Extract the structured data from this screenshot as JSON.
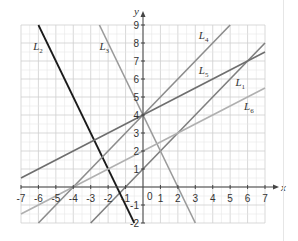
{
  "chart_data": {
    "type": "line",
    "title": "",
    "xlabel": "x",
    "ylabel": "y",
    "xlim": [
      -7,
      7
    ],
    "ylim": [
      -2,
      9
    ],
    "grid": true,
    "legend": "inline labels",
    "x_ticks": [
      -7,
      -6,
      -5,
      -4,
      -3,
      -2,
      -1,
      0,
      1,
      2,
      3,
      4,
      5,
      6,
      7
    ],
    "y_ticks": [
      -2,
      -1,
      1,
      2,
      3,
      4,
      5,
      6,
      7,
      8,
      9
    ],
    "series": [
      {
        "name": "L1",
        "equation": "y = x + 1",
        "slope": 1,
        "intercept": 1,
        "x": [
          -3,
          7
        ],
        "y": [
          -2,
          8
        ],
        "color": "#7f7f7f",
        "label_pos": [
          5.3,
          5.6
        ]
      },
      {
        "name": "L2",
        "equation": "y = -2x - 3",
        "slope": -2,
        "intercept": -3,
        "x": [
          -6,
          -0.5
        ],
        "y": [
          9,
          -2
        ],
        "color": "#1a1a1a",
        "label_pos": [
          -6.3,
          7.6
        ]
      },
      {
        "name": "L3",
        "equation": "y = -2x + 4",
        "slope": -2,
        "intercept": 4,
        "x": [
          -2.5,
          3
        ],
        "y": [
          9,
          -2
        ],
        "color": "#9a9a9a",
        "label_pos": [
          -2.5,
          7.6
        ]
      },
      {
        "name": "L4",
        "equation": "y = x + 4",
        "slope": 1,
        "intercept": 4,
        "x": [
          -6,
          5
        ],
        "y": [
          -2,
          9
        ],
        "color": "#8c8c8c",
        "label_pos": [
          3.2,
          8.2
        ]
      },
      {
        "name": "L5",
        "equation": "y = 0.5x + 4",
        "slope": 0.5,
        "intercept": 4,
        "x": [
          -7,
          7
        ],
        "y": [
          0.5,
          7.5
        ],
        "color": "#6e6e6e",
        "label_pos": [
          3.2,
          6.3
        ]
      },
      {
        "name": "L6",
        "equation": "y = 0.5x + 2",
        "slope": 0.5,
        "intercept": 2,
        "x": [
          -7,
          7
        ],
        "y": [
          -1.5,
          5.5
        ],
        "color": "#b0b0b0",
        "label_pos": [
          5.8,
          4.3
        ]
      }
    ],
    "annotations": [
      "0"
    ]
  },
  "labels": {
    "x_axis": "x",
    "y_axis": "y",
    "origin": "0"
  }
}
